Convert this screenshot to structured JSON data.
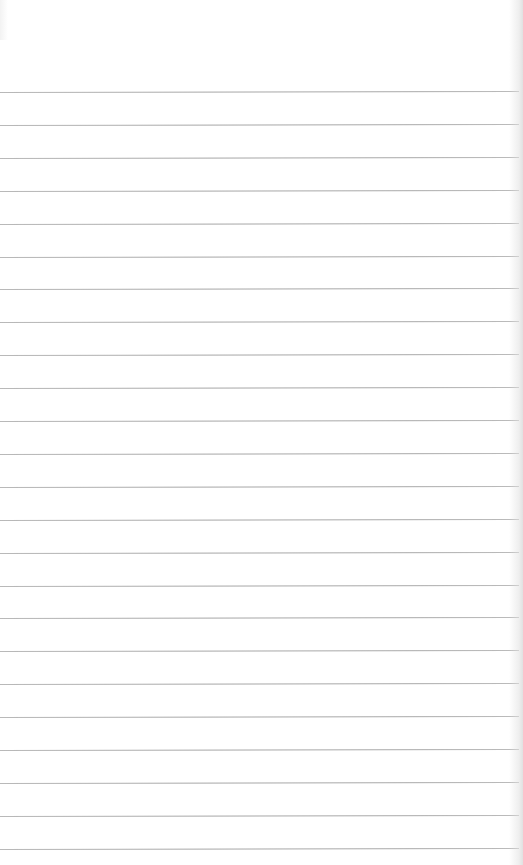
{
  "paper": {
    "background": "#ffffff",
    "rule_color": "#a8a8a8",
    "rule_count": 24,
    "first_rule_y": 92,
    "rule_spacing": 32.9,
    "rule_left": 0,
    "rule_right": 519
  }
}
